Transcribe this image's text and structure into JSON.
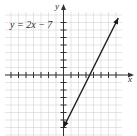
{
  "chart_data": {
    "type": "line",
    "title": "",
    "equation_label": "y = 2x − 7",
    "xlabel": "x",
    "ylabel": "y",
    "xlim": [
      -8,
      8
    ],
    "ylim": [
      -8,
      8
    ],
    "grid": true,
    "tick_spacing": 1,
    "series": [
      {
        "name": "y = 2x − 7",
        "x": [
          0,
          3.5,
          7.3
        ],
        "y": [
          -7,
          0,
          7.6
        ],
        "slope": 2,
        "intercept": -7,
        "arrowheads": "both"
      }
    ]
  },
  "colors": {
    "grid": "#d4d4d4",
    "axis": "#333333",
    "line": "#1a1a1a"
  }
}
